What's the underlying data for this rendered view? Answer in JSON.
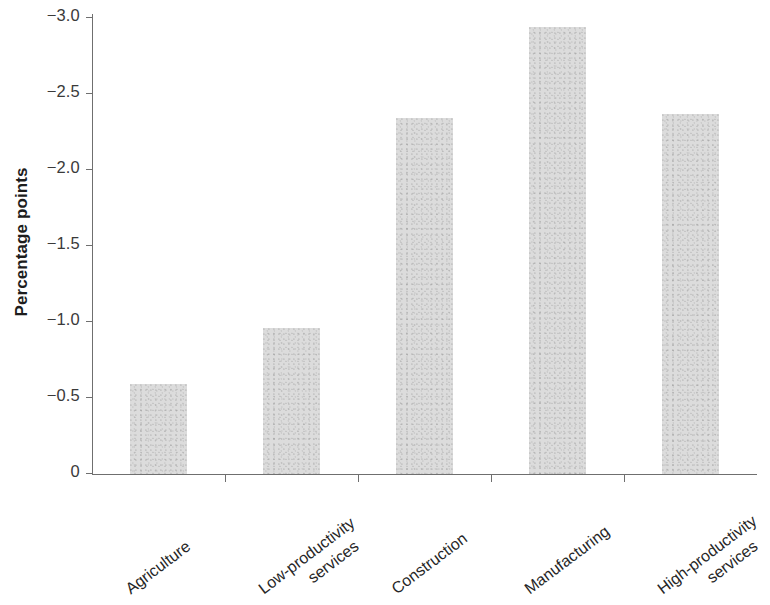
{
  "chart_data": {
    "type": "bar",
    "title": "",
    "subtitle": "",
    "xlabel": "",
    "ylabel": "Percentage points",
    "categories": [
      "Agriculture",
      "Low-productivity services",
      "Construction",
      "Manufacturing",
      "High-productivity services"
    ],
    "category_lines": [
      [
        "Agriculture"
      ],
      [
        "Low-productivity",
        "services"
      ],
      [
        "Construction"
      ],
      [
        "Manufacturing"
      ],
      [
        "High-productivity",
        "services"
      ]
    ],
    "values": [
      -0.59,
      -0.96,
      -2.34,
      -2.94,
      -2.37
    ],
    "magnitudes": [
      0.59,
      0.96,
      2.34,
      2.94,
      2.37
    ],
    "ylim": [
      0,
      -3.0
    ],
    "y_axis_inverted": true,
    "ytick_labels": [
      "−3.0",
      "−2.5",
      "−2.0",
      "−1.5",
      "−1.0",
      "−0.5",
      "0"
    ],
    "ytick_values": [
      -3.0,
      -2.5,
      -2.0,
      -1.5,
      -1.0,
      -0.5,
      0
    ],
    "grid": false,
    "legend": null,
    "bar_color": "#dcdcdc",
    "axis_color": "#6f6f6f",
    "text_color": "#262626"
  },
  "figure": {
    "background_color": "#ffffff",
    "y_axis_title": "Percentage points"
  }
}
